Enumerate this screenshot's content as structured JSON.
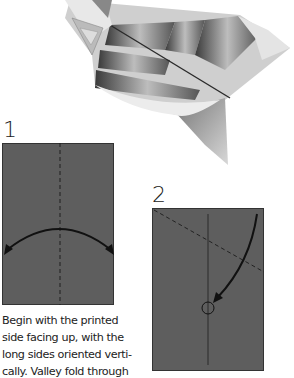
{
  "hero": {
    "image": "finished-origami-plane-model",
    "description": "Folded paper airplane with striped printed pattern"
  },
  "steps": [
    {
      "number": "1",
      "diagram": {
        "paper_color": "#5e5e5e",
        "fold_line": "vertical-center-dashed",
        "arrow": "double-headed-curved-arrow"
      },
      "caption_lines": [
        "Begin with the printed",
        "side facing up, with the",
        "long sides oriented verti-",
        "cally. Valley fold through"
      ]
    },
    {
      "number": "2",
      "diagram": {
        "paper_color": "#5e5e5e",
        "fold_line": "diagonal-dashed",
        "crease": "vertical-center-solid",
        "arrow": "curved-arrow-to-circle",
        "target": "circle-marker"
      }
    }
  ]
}
